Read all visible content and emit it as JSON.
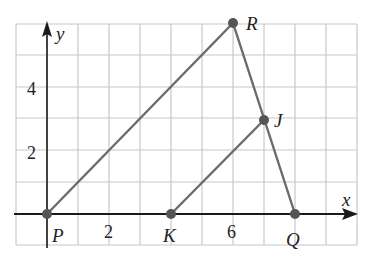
{
  "diagram": {
    "type": "coordinate-geometry",
    "axes": {
      "x_label": "x",
      "y_label": "y"
    },
    "tick_labels": {
      "x": [
        {
          "value": 2,
          "text": "2"
        },
        {
          "value": 6,
          "text": "6"
        }
      ],
      "y": [
        {
          "value": 2,
          "text": "2"
        },
        {
          "value": 4,
          "text": "4"
        }
      ]
    },
    "grid": {
      "x_range": [
        -1,
        10
      ],
      "y_range": [
        -1,
        6
      ],
      "step": 1
    },
    "points": [
      {
        "name": "P",
        "x": 0,
        "y": 0
      },
      {
        "name": "K",
        "x": 4,
        "y": 0
      },
      {
        "name": "Q",
        "x": 8,
        "y": 0
      },
      {
        "name": "R",
        "x": 6,
        "y": 6
      },
      {
        "name": "J",
        "x": 7,
        "y": 3
      }
    ],
    "segments": [
      [
        "P",
        "R"
      ],
      [
        "R",
        "Q"
      ],
      [
        "K",
        "J"
      ],
      [
        "P",
        "Q"
      ]
    ],
    "colors": {
      "segment": "#6b6b6b",
      "point": "#555555",
      "grid": "#c8c8c8",
      "axis": "#1a1a1a"
    }
  }
}
